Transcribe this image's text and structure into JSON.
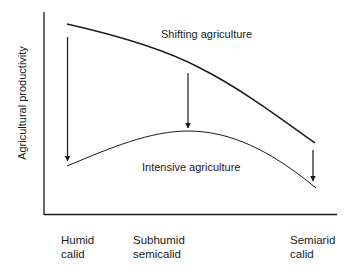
{
  "diagram": {
    "y_axis_label": "Agricultural productivity",
    "curves": [
      {
        "name": "shifting",
        "label": "Shifting agriculture"
      },
      {
        "name": "intensive",
        "label": "Intensive agriculture"
      }
    ],
    "x_categories": [
      {
        "line1": "Humid",
        "line2": "calid"
      },
      {
        "line1": "Subhumid",
        "line2": "semicalid"
      },
      {
        "line1": "Semiarid",
        "line2": "calid"
      }
    ],
    "colors": {
      "line": "#1a1a1a",
      "background": "#ffffff"
    }
  }
}
